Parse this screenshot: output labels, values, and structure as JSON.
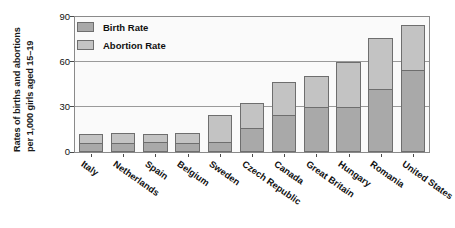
{
  "chart_data": {
    "type": "bar",
    "stacked": true,
    "title": "",
    "xlabel": "",
    "ylabel": "Rates of births and abortions per 1,000 girls aged 15–19",
    "ylabel_lines": [
      "Rates of births and abortions",
      "per 1,000 girls aged 15–19"
    ],
    "ylim": [
      0,
      90
    ],
    "yticks": [
      0,
      30,
      60,
      90
    ],
    "ytick_labels": [
      "0",
      "30",
      "60",
      "90"
    ],
    "grid": true,
    "legend_position": "top-left",
    "categories": [
      "Italy",
      "Netherlands",
      "Spain",
      "Belgium",
      "Sweden",
      "Czech Republic",
      "Canada",
      "Great Britain",
      "Hungary",
      "Romania",
      "United States"
    ],
    "series": [
      {
        "name": "Birth Rate",
        "color": "#a9a9a9",
        "values": [
          6,
          6,
          7,
          6,
          7,
          16,
          25,
          30,
          30,
          42,
          55
        ]
      },
      {
        "name": "Abortion Rate",
        "color": "#c3c3c3",
        "values": [
          6,
          7,
          5,
          7,
          18,
          17,
          22,
          21,
          30,
          34,
          30
        ]
      }
    ],
    "totals": [
      12,
      13,
      12,
      13,
      25,
      33,
      47,
      51,
      60,
      76,
      85
    ]
  },
  "legend": {
    "items": [
      {
        "label": "Birth Rate",
        "swatch": "#a9a9a9"
      },
      {
        "label": "Abortion Rate",
        "swatch": "#c3c3c3"
      }
    ]
  },
  "colors": {
    "birth_rate": "#a9a9a9",
    "abortion_rate": "#c3c3c3",
    "plot_background": "#fafafa",
    "axis_line": "#8a8a8a",
    "gridline": "#9a9a9a",
    "bar_border": "#6e6e6e",
    "text": "#111111"
  }
}
